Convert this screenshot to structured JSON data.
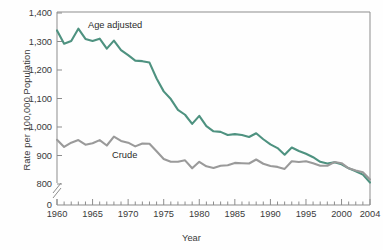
{
  "chart_data": {
    "type": "line",
    "title": "",
    "xlabel": "Year",
    "ylabel": "Rate per 100,000 Population",
    "xlim": [
      1960,
      2004
    ],
    "ylim": [
      770,
      1400
    ],
    "y_axis_break": true,
    "y_axis_break_note": "axis broken between 0 and 800",
    "grid": false,
    "legend_position": "inline-labels",
    "ytick_labels": [
      "1,400",
      "1,300",
      "1,200",
      "1,100",
      "1,000",
      "900",
      "800",
      "0"
    ],
    "ytick_values": [
      1400,
      1300,
      1200,
      1100,
      1000,
      900,
      800,
      0
    ],
    "xtick_labels": [
      "1960",
      "1965",
      "1970",
      "1975",
      "1980",
      "1985",
      "1990",
      "1995",
      "2000",
      "2004"
    ],
    "xtick_values": [
      1960,
      1965,
      1970,
      1975,
      1980,
      1985,
      1990,
      1995,
      2000,
      2004
    ],
    "x": [
      1960,
      1961,
      1962,
      1963,
      1964,
      1965,
      1966,
      1967,
      1968,
      1969,
      1970,
      1971,
      1972,
      1973,
      1974,
      1975,
      1976,
      1977,
      1978,
      1979,
      1980,
      1981,
      1982,
      1983,
      1984,
      1985,
      1986,
      1987,
      1988,
      1989,
      1990,
      1991,
      1992,
      1993,
      1994,
      1995,
      1996,
      1997,
      1998,
      1999,
      2000,
      2001,
      2002,
      2003,
      2004
    ],
    "series": [
      {
        "name": "Age adjusted",
        "color": "#4e9280",
        "values": [
          1339,
          1292,
          1302,
          1345,
          1309,
          1302,
          1310,
          1275,
          1303,
          1270,
          1252,
          1233,
          1231,
          1226,
          1170,
          1125,
          1098,
          1060,
          1043,
          1011,
          1039,
          1003,
          985,
          983,
          972,
          975,
          972,
          965,
          978,
          957,
          939,
          926,
          903,
          928,
          916,
          906,
          894,
          878,
          872,
          876,
          869,
          855,
          845,
          833,
          805
        ]
      },
      {
        "name": "Crude",
        "color": "#9a9a9a",
        "values": [
          955,
          930,
          945,
          954,
          938,
          943,
          954,
          935,
          966,
          951,
          945,
          932,
          942,
          941,
          915,
          888,
          878,
          878,
          883,
          855,
          878,
          862,
          856,
          864,
          866,
          874,
          873,
          872,
          886,
          871,
          863,
          860,
          853,
          880,
          877,
          880,
          873,
          864,
          864,
          877,
          873,
          855,
          847,
          841,
          816
        ]
      }
    ],
    "annotations": [
      {
        "text": "Age adjusted",
        "series": "Age adjusted"
      },
      {
        "text": "Crude",
        "series": "Crude"
      }
    ]
  },
  "axis": {
    "x_title": "Year",
    "y_title": "Rate per 100,000 Population"
  }
}
